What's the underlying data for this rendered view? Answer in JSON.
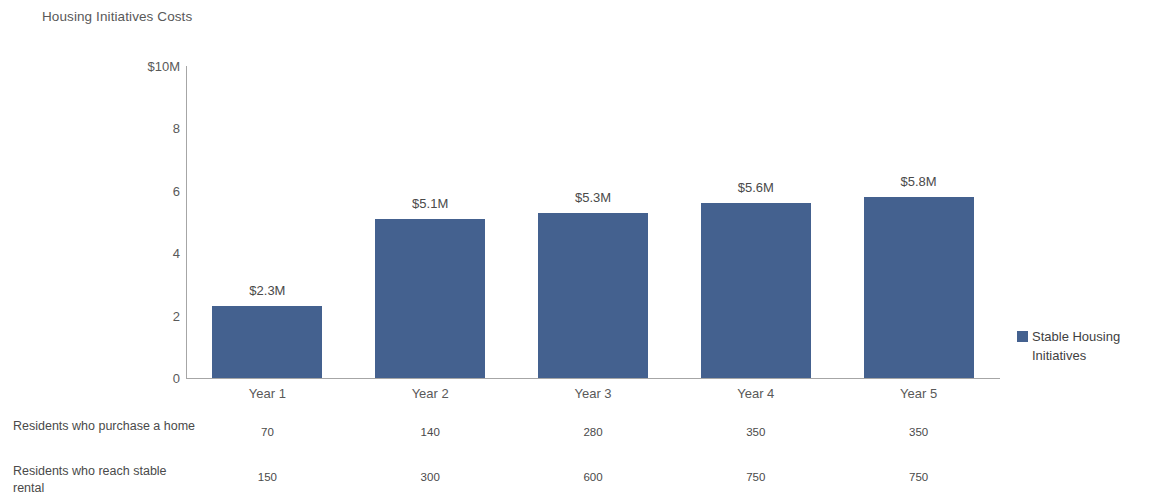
{
  "chart_data": {
    "type": "bar",
    "title": "Housing Initiatives Costs",
    "categories": [
      "Year 1",
      "Year 2",
      "Year 3",
      "Year 4",
      "Year 5"
    ],
    "series": [
      {
        "name": "Stable Housing Initiatives",
        "values": [
          2.3,
          5.1,
          5.3,
          5.6,
          5.8
        ],
        "data_labels": [
          "$2.3M",
          "$5.1M",
          "$5.3M",
          "$5.6M",
          "$5.8M"
        ],
        "color": "#44618f"
      }
    ],
    "xlabel": "",
    "ylabel": "",
    "ylim": [
      0,
      10
    ],
    "y_ticks": [
      0,
      2,
      4,
      6,
      8,
      10
    ],
    "y_tick_labels": [
      "0",
      "2",
      "4",
      "6",
      "8",
      "$10M"
    ],
    "grid": false,
    "legend_position": "right",
    "units": "millions of dollars",
    "data_table": {
      "rows": [
        {
          "label": "Residents who purchase a home",
          "values": [
            "70",
            "140",
            "280",
            "350",
            "350"
          ]
        },
        {
          "label": "Residents who reach stable rental",
          "values": [
            "150",
            "300",
            "600",
            "750",
            "750"
          ]
        }
      ]
    }
  },
  "legend": {
    "entries": [
      {
        "label": "Stable Housing Initiatives",
        "color": "#44618f"
      }
    ]
  },
  "colors": {
    "bar": "#44618f",
    "axis": "#a6a6a6",
    "text": "#595959",
    "background": "#ffffff"
  }
}
